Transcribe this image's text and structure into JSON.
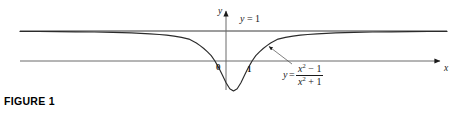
{
  "figure": {
    "caption": "FIGURE 1",
    "background_color": "#ffffff",
    "ink_color": "#1a1a1a"
  },
  "axes": {
    "x_label": "x",
    "y_label": "y",
    "origin_label": "0",
    "tick_label_one": "1"
  },
  "labels": {
    "asymptote": "y = 1",
    "function_lhs": "y",
    "function_equals": "=",
    "function_numerator_base": "x",
    "function_numerator_exp": "2",
    "function_numerator_tail": "− 1",
    "function_denominator_base": "x",
    "function_denominator_exp": "2",
    "function_denominator_tail": "+ 1"
  },
  "chart_data": {
    "type": "line",
    "title": "FIGURE 1",
    "xlabel": "x",
    "ylabel": "y",
    "function": "y = (x^2 - 1) / (x^2 + 1)",
    "asymptote": {
      "type": "horizontal",
      "value": 1,
      "label": "y = 1"
    },
    "grid": false,
    "legend": "none",
    "xlim": [
      -11.5,
      11.5
    ],
    "ylim": [
      -1.6,
      1.75
    ],
    "annotations": [
      {
        "text": "y = 1",
        "x": 0.8,
        "y": 1.35
      },
      {
        "text": "y = (x^2 - 1)/(x^2 + 1)",
        "x": 3.2,
        "y": -0.6
      },
      {
        "text": "0",
        "x": -0.45,
        "y": -0.22
      },
      {
        "text": "1",
        "x": 1.1,
        "y": -0.25
      }
    ],
    "x_ticks": [
      0,
      1
    ],
    "x_tick_labels": [
      "0",
      "1"
    ],
    "series": [
      {
        "name": "y = (x^2 - 1)/(x^2 + 1)",
        "x": [
          -11.5,
          -10.5,
          -9.5,
          -8.5,
          -7.5,
          -6.5,
          -6.0,
          -5.5,
          -5.0,
          -4.5,
          -4.0,
          -3.6,
          -3.2,
          -2.8,
          -2.4,
          -2.0,
          -1.8,
          -1.6,
          -1.4,
          -1.2,
          -1.0,
          -0.8,
          -0.6,
          -0.4,
          -0.2,
          0.0,
          0.2,
          0.4,
          0.6,
          0.8,
          1.0,
          1.2,
          1.4,
          1.6,
          1.8,
          2.0,
          2.4,
          2.8,
          3.2,
          3.6,
          4.0,
          4.5,
          5.0,
          5.5,
          6.0,
          6.5,
          7.5,
          8.5,
          9.5,
          10.5,
          11.5
        ],
        "y": [
          0.985,
          0.982,
          0.978,
          0.973,
          0.965,
          0.953,
          0.946,
          0.936,
          0.923,
          0.906,
          0.882,
          0.861,
          0.831,
          0.789,
          0.731,
          0.6,
          0.512,
          0.415,
          0.306,
          0.18,
          0.0,
          -0.22,
          -0.47,
          -0.724,
          -0.923,
          -1.0,
          -0.923,
          -0.724,
          -0.47,
          -0.22,
          0.0,
          0.18,
          0.306,
          0.415,
          0.512,
          0.6,
          0.731,
          0.789,
          0.831,
          0.861,
          0.882,
          0.906,
          0.923,
          0.936,
          0.946,
          0.953,
          0.965,
          0.973,
          0.978,
          0.982,
          0.985
        ]
      }
    ]
  }
}
